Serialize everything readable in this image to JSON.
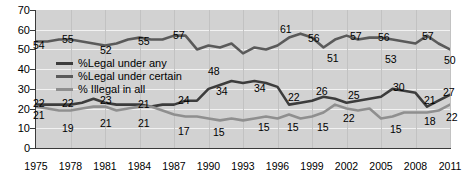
{
  "chart_data": {
    "type": "line",
    "title": "",
    "subtitle": "",
    "xlabel": "",
    "ylabel": "",
    "xlim": [
      1975,
      2011
    ],
    "ylim": [
      0,
      70
    ],
    "grid": true,
    "legend_position": "inside-upper-left",
    "x_tick_labels": [
      "1975",
      "1978",
      "1981",
      "1984",
      "1987",
      "1990",
      "1993",
      "1996",
      "1999",
      "2002",
      "2005",
      "2008",
      "2011"
    ],
    "y_tick_labels": [
      "0",
      "10",
      "20",
      "30",
      "40",
      "50",
      "60",
      "70"
    ],
    "x": [
      1975,
      1976,
      1977,
      1978,
      1979,
      1980,
      1981,
      1982,
      1983,
      1984,
      1985,
      1986,
      1987,
      1988,
      1989,
      1990,
      1991,
      1992,
      1993,
      1994,
      1995,
      1996,
      1997,
      1998,
      1999,
      2000,
      2001,
      2002,
      2003,
      2004,
      2005,
      2006,
      2007,
      2008,
      2009,
      2010,
      2011
    ],
    "series": [
      {
        "name": "%Legal under certain",
        "color": "#5a5a5a",
        "values": [
          54,
          54,
          55,
          55,
          54,
          53,
          52,
          53,
          55,
          56,
          55,
          55,
          57,
          57,
          50,
          52,
          51,
          53,
          48,
          51,
          50,
          52,
          56,
          58,
          56,
          51,
          55,
          57,
          55,
          56,
          56,
          55,
          54,
          53,
          57,
          53,
          50
        ]
      },
      {
        "name": "%Legal under any",
        "color": "#3c3c3c",
        "values": [
          22,
          22,
          22,
          22,
          23,
          25,
          23,
          22,
          22,
          22,
          21,
          22,
          22,
          24,
          24,
          30,
          32,
          34,
          33,
          34,
          33,
          31,
          22,
          23,
          24,
          26,
          25,
          23,
          24,
          25,
          26,
          30,
          29,
          28,
          21,
          24,
          27
        ]
      },
      {
        "name": "% Illegal in all",
        "color": "#8f8f8f",
        "values": [
          21,
          20,
          19,
          19,
          20,
          21,
          21,
          19,
          20,
          21,
          21,
          19,
          17,
          16,
          16,
          15,
          14,
          15,
          14,
          15,
          16,
          15,
          17,
          15,
          16,
          18,
          22,
          20,
          19,
          20,
          15,
          16,
          18,
          18,
          18,
          19,
          22
        ]
      }
    ],
    "annotations": [
      {
        "series": "top",
        "x": 1975,
        "value": "54",
        "pos": {
          "left": 33,
          "top": 40
        }
      },
      {
        "series": "top",
        "x": 1978,
        "value": "55",
        "pos": {
          "left": 62,
          "top": 34
        }
      },
      {
        "series": "top",
        "x": 1981,
        "value": "52",
        "pos": {
          "left": 100,
          "top": 45
        }
      },
      {
        "series": "top",
        "x": 1984,
        "value": "55",
        "pos": {
          "left": 138,
          "top": 36
        }
      },
      {
        "series": "top",
        "x": 1987,
        "value": "57",
        "pos": {
          "left": 173,
          "top": 30
        }
      },
      {
        "series": "top",
        "x": 1993,
        "value": "48",
        "pos": {
          "left": 208,
          "top": 66
        }
      },
      {
        "series": "top",
        "x": 1996,
        "value": "61",
        "pos": {
          "left": 280,
          "top": 24
        }
      },
      {
        "series": "top",
        "x": 1998,
        "value": "56",
        "pos": {
          "left": 308,
          "top": 33
        }
      },
      {
        "series": "top",
        "x": 2000,
        "value": "51",
        "pos": {
          "left": 327,
          "top": 53
        }
      },
      {
        "series": "top",
        "x": 2002,
        "value": "57",
        "pos": {
          "left": 350,
          "top": 31
        }
      },
      {
        "series": "top",
        "x": 2004,
        "value": "56",
        "pos": {
          "left": 378,
          "top": 32
        }
      },
      {
        "series": "top",
        "x": 2005,
        "value": "53",
        "pos": {
          "left": 385,
          "top": 54
        }
      },
      {
        "series": "top",
        "x": 2009,
        "value": "57",
        "pos": {
          "left": 422,
          "top": 31
        }
      },
      {
        "series": "top",
        "x": 2011,
        "value": "50",
        "pos": {
          "left": 444,
          "top": 55
        }
      },
      {
        "series": "mid",
        "x": 1975,
        "value": "22",
        "pos": {
          "left": 33,
          "top": 98
        }
      },
      {
        "series": "mid",
        "x": 1978,
        "value": "22",
        "pos": {
          "left": 62,
          "top": 98
        }
      },
      {
        "series": "mid",
        "x": 1981,
        "value": "23",
        "pos": {
          "left": 100,
          "top": 95
        }
      },
      {
        "series": "mid",
        "x": 1984,
        "value": "21",
        "pos": {
          "left": 138,
          "top": 99
        }
      },
      {
        "series": "mid",
        "x": 1988,
        "value": "24",
        "pos": {
          "left": 178,
          "top": 95
        }
      },
      {
        "series": "mid",
        "x": 1992,
        "value": "34",
        "pos": {
          "left": 216,
          "top": 86
        }
      },
      {
        "series": "mid",
        "x": 1995,
        "value": "34",
        "pos": {
          "left": 254,
          "top": 83
        }
      },
      {
        "series": "mid",
        "x": 1997,
        "value": "22",
        "pos": {
          "left": 288,
          "top": 92
        }
      },
      {
        "series": "mid",
        "x": 2000,
        "value": "26",
        "pos": {
          "left": 316,
          "top": 86
        }
      },
      {
        "series": "mid",
        "x": 2002,
        "value": "25",
        "pos": {
          "left": 348,
          "top": 90
        }
      },
      {
        "series": "mid",
        "x": 2006,
        "value": "30",
        "pos": {
          "left": 393,
          "top": 82
        }
      },
      {
        "series": "mid",
        "x": 2009,
        "value": "21",
        "pos": {
          "left": 424,
          "top": 95
        }
      },
      {
        "series": "mid",
        "x": 2011,
        "value": "27",
        "pos": {
          "left": 443,
          "top": 87
        }
      },
      {
        "series": "low",
        "x": 1975,
        "value": "21",
        "pos": {
          "left": 33,
          "top": 110
        }
      },
      {
        "series": "low",
        "x": 1977,
        "value": "19",
        "pos": {
          "left": 62,
          "top": 123
        }
      },
      {
        "series": "low",
        "x": 1981,
        "value": "21",
        "pos": {
          "left": 100,
          "top": 118
        }
      },
      {
        "series": "low",
        "x": 1984,
        "value": "21",
        "pos": {
          "left": 138,
          "top": 118
        }
      },
      {
        "series": "low",
        "x": 1987,
        "value": "17",
        "pos": {
          "left": 178,
          "top": 126
        }
      },
      {
        "series": "low",
        "x": 1992,
        "value": "15",
        "pos": {
          "left": 213,
          "top": 127
        }
      },
      {
        "series": "low",
        "x": 1994,
        "value": "15",
        "pos": {
          "left": 258,
          "top": 122
        }
      },
      {
        "series": "low",
        "x": 1996,
        "value": "15",
        "pos": {
          "left": 287,
          "top": 122
        }
      },
      {
        "series": "low",
        "x": 1999,
        "value": "15",
        "pos": {
          "left": 317,
          "top": 122
        }
      },
      {
        "series": "low",
        "x": 2001,
        "value": "22",
        "pos": {
          "left": 343,
          "top": 113
        }
      },
      {
        "series": "low",
        "x": 2005,
        "value": "15",
        "pos": {
          "left": 390,
          "top": 124
        }
      },
      {
        "series": "low",
        "x": 2008,
        "value": "18",
        "pos": {
          "left": 424,
          "top": 116
        }
      },
      {
        "series": "low",
        "x": 2011,
        "value": "22",
        "pos": {
          "left": 446,
          "top": 112
        }
      }
    ]
  },
  "legend": {
    "items": [
      {
        "label": "%Legal under any",
        "color": "#3c3c3c"
      },
      {
        "label": "%Legal under certain",
        "color": "#5a5a5a"
      },
      {
        "label": "% Illegal in all",
        "color": "#8f8f8f"
      }
    ]
  },
  "colors": {
    "plot_background": "#d2d2d2",
    "gridline": "#f2f2f2",
    "axis": "#3a3a3a",
    "page_background": "#ffffff"
  }
}
